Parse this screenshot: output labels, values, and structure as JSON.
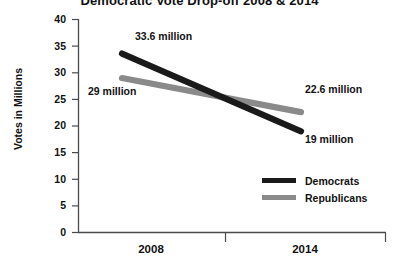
{
  "chart_data": {
    "type": "line",
    "title": "Democratic Vote Drop-off 2008 & 2014",
    "xlabel": "",
    "ylabel": "Votes in Millions",
    "categories": [
      "2008",
      "2014"
    ],
    "ylim": [
      0,
      40
    ],
    "yticks": [
      "0",
      "5",
      "10",
      "15",
      "20",
      "25",
      "30",
      "35",
      "40"
    ],
    "grid": false,
    "legend_position": "bottom-right",
    "series": [
      {
        "name": "Democrats",
        "color": "#1a1a1a",
        "values": [
          33.6,
          19
        ],
        "point_labels": [
          "33.6 million",
          "19 million"
        ]
      },
      {
        "name": "Republicans",
        "color": "#8a8a8a",
        "values": [
          29,
          22.6
        ],
        "point_labels": [
          "29 million",
          "22.6 million"
        ]
      }
    ],
    "annotations": [
      {
        "text": "33.6 million",
        "series": "Democrats",
        "category": "2008"
      },
      {
        "text": "29 million",
        "series": "Republicans",
        "category": "2008"
      },
      {
        "text": "22.6 million",
        "series": "Republicans",
        "category": "2014"
      },
      {
        "text": "19 million",
        "series": "Democrats",
        "category": "2014"
      }
    ]
  },
  "axis": {
    "color": "#4a4a4a"
  }
}
